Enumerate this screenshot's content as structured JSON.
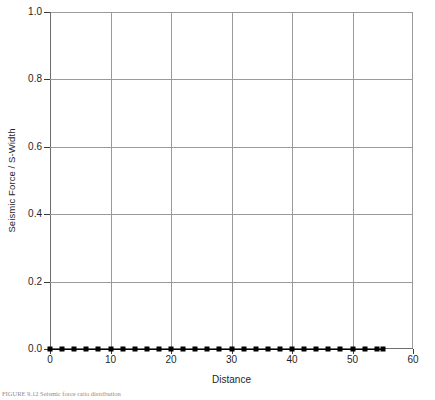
{
  "chart_data": {
    "type": "line",
    "title": "",
    "xlabel": "Distance",
    "ylabel": "Seismic Force / S-Width",
    "xlim": [
      0,
      60
    ],
    "ylim": [
      0,
      1.0
    ],
    "xticks": [
      0,
      10,
      20,
      30,
      40,
      50,
      60
    ],
    "xtick_labels": [
      "0",
      "10",
      "20",
      "30",
      "40",
      "50",
      "60"
    ],
    "yticks": [
      0.0,
      0.2,
      0.4,
      0.6,
      0.8,
      1.0
    ],
    "ytick_labels": [
      "0.0",
      "0.2",
      "0.4",
      "0.6",
      "0.8",
      "1.0"
    ],
    "grid": true,
    "legend": "none",
    "marker": "filled-square",
    "marker_color": "#000000",
    "line_color": "#000000",
    "series": [
      {
        "name": "Seismic Force / S-Width",
        "x": [
          0,
          2,
          4,
          6,
          8,
          10,
          12,
          14,
          16,
          18,
          20,
          22,
          24,
          26,
          28,
          30,
          32,
          34,
          36,
          38,
          40,
          42,
          44,
          46,
          48,
          50,
          52,
          54,
          55
        ],
        "values": [
          0,
          0,
          0,
          0,
          0,
          0,
          0,
          0,
          0,
          0,
          0,
          0,
          0,
          0,
          0,
          0,
          0,
          0,
          0,
          0,
          0,
          0,
          0,
          0,
          0,
          0,
          0,
          0,
          0
        ]
      }
    ]
  },
  "caption": {
    "text": "FIGURE 9.12   Seismic force ratio distribution"
  }
}
